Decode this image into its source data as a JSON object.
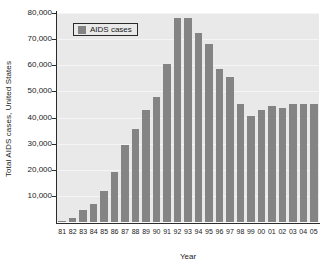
{
  "chart_data": {
    "type": "bar",
    "title": "",
    "xlabel": "Year",
    "ylabel": "Total AIDS cases, United States",
    "categories": [
      "81",
      "82",
      "83",
      "84",
      "85",
      "86",
      "87",
      "88",
      "89",
      "90",
      "91",
      "92",
      "93",
      "94",
      "95",
      "96",
      "97",
      "98",
      "99",
      "00",
      "01",
      "02",
      "03",
      "04",
      "05"
    ],
    "values": [
      300,
      1500,
      4500,
      6900,
      11800,
      19200,
      29500,
      35500,
      43000,
      48000,
      60500,
      78000,
      78200,
      72500,
      68000,
      58500,
      55500,
      45000,
      40500,
      43000,
      44500,
      43500,
      45000,
      45000,
      45000
    ],
    "series": [
      {
        "name": "AIDS cases",
        "values": [
          300,
          1500,
          4500,
          6900,
          11800,
          19200,
          29500,
          35500,
          43000,
          48000,
          60500,
          78000,
          78200,
          72500,
          68000,
          58500,
          55500,
          45000,
          40500,
          43000,
          44500,
          43500,
          45000,
          45000,
          45000
        ]
      }
    ],
    "ylim": [
      0,
      80000
    ],
    "yticks": [
      10000,
      20000,
      30000,
      40000,
      50000,
      60000,
      70000,
      80000
    ],
    "ytick_labels": [
      "10,000",
      "20,000",
      "30,000",
      "40,000",
      "50,000",
      "60,000",
      "70,000",
      "80,000"
    ],
    "grid": true,
    "legend": {
      "position": "top-left",
      "entries": [
        {
          "label": "AIDS cases",
          "color": "#848484"
        }
      ]
    },
    "colors": {
      "bar": "#848484",
      "plot_background": "#e9e9e9",
      "gridline": "#f5f5f5",
      "axis": "#2b2b2b",
      "text": "#1a1a1a"
    }
  }
}
